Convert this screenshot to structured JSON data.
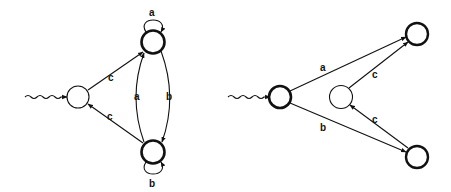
{
  "diagrams": [
    {
      "name": "left-automaton",
      "states": [
        {
          "id": "q0",
          "initial": true,
          "accepting": false
        },
        {
          "id": "q1",
          "initial": false,
          "accepting": true
        },
        {
          "id": "q2",
          "initial": false,
          "accepting": true
        }
      ],
      "edges": [
        {
          "from": "q0",
          "to": "q1",
          "label": "c"
        },
        {
          "from": "q2",
          "to": "q0",
          "label": "c"
        },
        {
          "from": "q1",
          "to": "q1",
          "label": "a"
        },
        {
          "from": "q2",
          "to": "q2",
          "label": "b"
        },
        {
          "from": "q2",
          "to": "q1",
          "label": "a"
        },
        {
          "from": "q1",
          "to": "q2",
          "label": "b"
        }
      ]
    },
    {
      "name": "right-automaton",
      "states": [
        {
          "id": "p0",
          "initial": true,
          "accepting": true
        },
        {
          "id": "p1",
          "initial": false,
          "accepting": false
        },
        {
          "id": "p2",
          "initial": false,
          "accepting": true
        },
        {
          "id": "p3",
          "initial": false,
          "accepting": true
        }
      ],
      "edges": [
        {
          "from": "p0",
          "to": "p2",
          "label": "a"
        },
        {
          "from": "p0",
          "to": "p3",
          "label": "b"
        },
        {
          "from": "p1",
          "to": "p2",
          "label": "c"
        },
        {
          "from": "p3",
          "to": "p1",
          "label": "c"
        }
      ]
    }
  ],
  "labels": {
    "l_c_up": "c",
    "l_c_down": "c",
    "l_a_loop": "a",
    "l_b_loop": "b",
    "l_a_mid": "a",
    "l_b_mid": "b",
    "r_a": "a",
    "r_b": "b",
    "r_c_up": "c",
    "r_c_down": "c"
  }
}
